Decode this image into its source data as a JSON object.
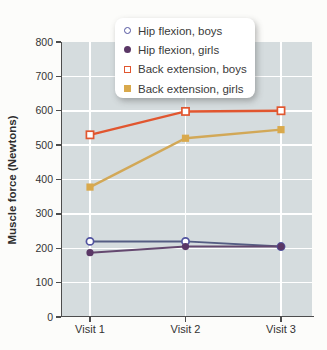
{
  "chart_data": {
    "type": "line",
    "title": "",
    "categories": [
      "Visit 1",
      "Visit 2",
      "Visit 3"
    ],
    "series": [
      {
        "name": "Hip flexion, boys",
        "values": [
          220,
          220,
          205
        ],
        "line_color": "#555d83",
        "marker": "circle",
        "marker_fill": "open",
        "marker_color": "#5254a0"
      },
      {
        "name": "Hip flexion, girls",
        "values": [
          187,
          205,
          205
        ],
        "line_color": "#64486f",
        "marker": "circle",
        "marker_fill": "solid",
        "marker_color": "#5a3766"
      },
      {
        "name": "Back extension, boys",
        "values": [
          530,
          598,
          600
        ],
        "line_color": "#e1562f",
        "marker": "square",
        "marker_fill": "open",
        "marker_color": "#e1562f"
      },
      {
        "name": "Back extension, girls",
        "values": [
          378,
          520,
          545
        ],
        "line_color": "#d2a857",
        "marker": "square",
        "marker_fill": "solid",
        "marker_color": "#d9a94c"
      }
    ],
    "xlabel": "",
    "ylabel": "Muscle force (Newtons)",
    "ylim": [
      0,
      800
    ],
    "ytick_step": 100,
    "grid": true,
    "legend_position": "top-center",
    "plot_background": "#d5dcde",
    "grid_color": "#ffffff",
    "axis_color": "#4d4d4d"
  }
}
